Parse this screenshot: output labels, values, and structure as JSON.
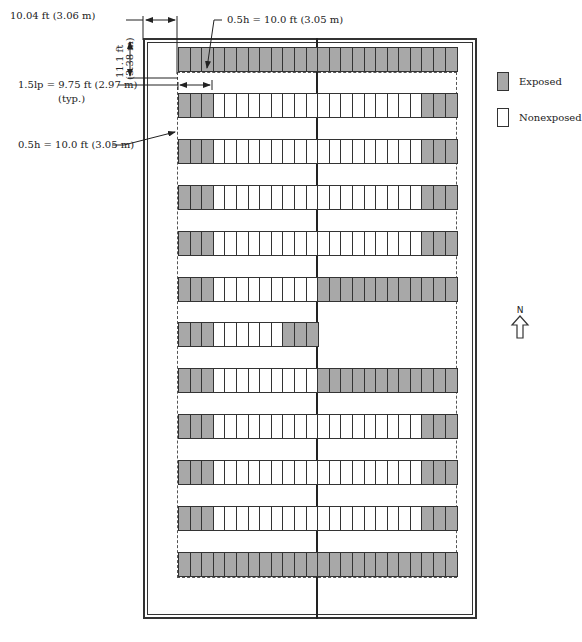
{
  "dimensions": {
    "top_offset": "10.04 ft (3.06 m)",
    "side_offset_line1": "11.1 ft",
    "side_offset_line2": "(3.38 m)",
    "top_boundary": "0.5h = 10.0 ft (3.05 m)",
    "typ_width_line1": "1.5lp = 9.75 ft (2.97 m)",
    "typ_width_line2": "(typ.)",
    "left_boundary": "0.5h = 10.0 ft (3.05 m)"
  },
  "legend": {
    "items": [
      {
        "label": "Exposed",
        "color": "#a8a8a8"
      },
      {
        "label": "Nonexposed",
        "color": "#ffffff"
      }
    ]
  },
  "north_arrow": {
    "label": "N"
  },
  "array": {
    "cells_per_row": 24,
    "rows": [
      {
        "pattern": "EEEEEEEEEEEEEEEEEEEEEEEE"
      },
      {
        "pattern": "EEENNNNNNNNNNNNNNNNNNEEE"
      },
      {
        "pattern": "EEENNNNNNNNNNNNNNNNNNEEE"
      },
      {
        "pattern": "EEENNNNNNNNNNNNNNNNNNEEE"
      },
      {
        "pattern": "EEENNNNNNNNNNNNNNNNNNEEE"
      },
      {
        "pattern": "EEENNNNNNNNNEEEEEEEEEEEE"
      },
      {
        "pattern": "EEENNNNNNEEE"
      },
      {
        "pattern": "EEENNNNNNNNNEEEEEEEEEEEE"
      },
      {
        "pattern": "EEENNNNNNNNNNNNNNNNNNEEE"
      },
      {
        "pattern": "EEENNNNNNNNNNNNNNNNNNEEE"
      },
      {
        "pattern": "EEENNNNNNNNNNNNNNNNNNEEE"
      },
      {
        "pattern": "EEEEEEEEEEEEEEEEEEEEEEEE"
      }
    ]
  }
}
